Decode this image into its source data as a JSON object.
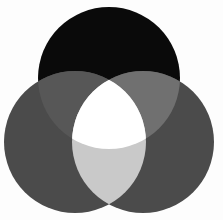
{
  "diagram": {
    "type": "three-circle-venn",
    "background": "#fdfdfd",
    "circles": [
      {
        "id": "top",
        "cx": 109,
        "cy": 78,
        "r": 71,
        "color": "#0a0a0a"
      },
      {
        "id": "left",
        "cx": 75,
        "cy": 142,
        "r": 71,
        "color": "#4b4b4b"
      },
      {
        "id": "right",
        "cx": 143,
        "cy": 142,
        "r": 71,
        "color": "#4b4b4b"
      }
    ],
    "regions": {
      "top_only": "#0a0a0a",
      "left_only": "#4b4b4b",
      "right_only": "#4b4b4b",
      "top_and_left": "#575757",
      "top_and_right": "#707070",
      "left_and_right": "#c9c9c9",
      "all_three": "#ffffff"
    }
  }
}
